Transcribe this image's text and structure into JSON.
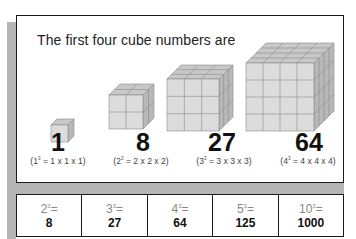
{
  "title": "The first four cube numbers are",
  "cubes": [
    {
      "n": 1,
      "value": "1",
      "formula_base": "(1",
      "formula_exp": "3",
      "formula_rest": " = 1 x 1 x 1)"
    },
    {
      "n": 2,
      "value": "8",
      "formula_base": "(2",
      "formula_exp": "3",
      "formula_rest": " = 2 x 2 x 2)"
    },
    {
      "n": 3,
      "value": "27",
      "formula_base": "(3",
      "formula_exp": "3",
      "formula_rest": " = 3 x 3 x 3)"
    },
    {
      "n": 4,
      "value": "64",
      "formula_base": "(4",
      "formula_exp": "3",
      "formula_rest": " = 4 x 4 x 4)"
    }
  ],
  "table": [
    {
      "base": "2",
      "exp": "3",
      "eq": "=",
      "result": "8"
    },
    {
      "base": "3",
      "exp": "3",
      "eq": "=",
      "result": "27"
    },
    {
      "base": "4",
      "exp": "3",
      "eq": "=",
      "result": "64"
    },
    {
      "base": "5",
      "exp": "3",
      "eq": "=",
      "result": "125"
    },
    {
      "base": "10",
      "exp": "3",
      "eq": "=",
      "result": "1000"
    }
  ],
  "colors": {
    "border": "#1a1a1a",
    "shadow": "#b5b5b5",
    "cube_front": "#dcdcdc",
    "cube_top": "#c8c8c8",
    "cube_side": "#b8b8b8",
    "expr_text": "#888888"
  }
}
